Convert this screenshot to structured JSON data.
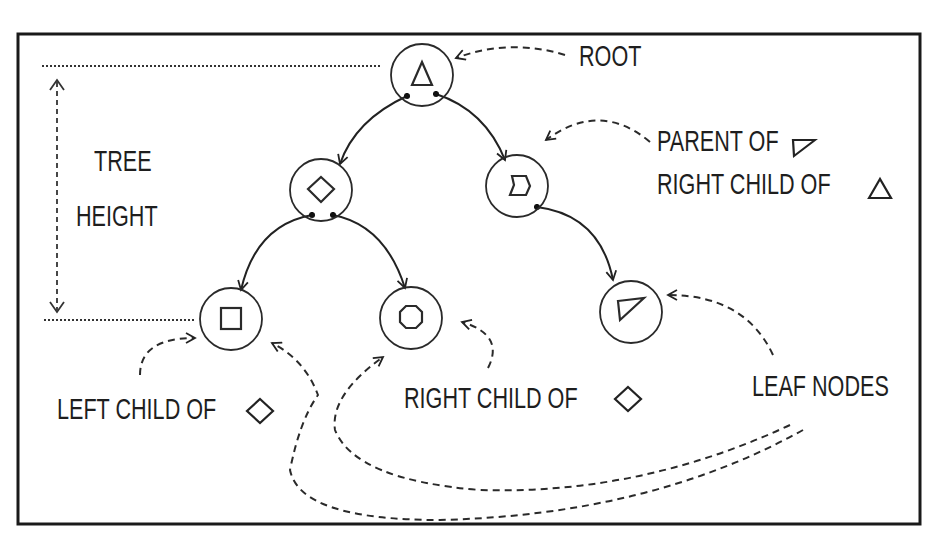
{
  "diagram": {
    "frame": {
      "x": 17,
      "y": 33,
      "width": 904,
      "height": 492,
      "stroke": "#222222"
    },
    "colors": {
      "ink": "#222222",
      "background": "#ffffff"
    },
    "nodes": [
      {
        "id": "root",
        "symbol": "triangle",
        "cx": 422,
        "cy": 75,
        "r": 31
      },
      {
        "id": "diamond",
        "symbol": "diamond",
        "cx": 321,
        "cy": 190,
        "r": 31
      },
      {
        "id": "notch",
        "symbol": "notched-pentagon",
        "cx": 517,
        "cy": 186,
        "r": 31
      },
      {
        "id": "square",
        "symbol": "square",
        "cx": 231,
        "cy": 319,
        "r": 31
      },
      {
        "id": "octagon",
        "symbol": "octagon",
        "cx": 411,
        "cy": 318,
        "r": 31
      },
      {
        "id": "right-triangle",
        "symbol": "right-triangle",
        "cx": 631,
        "cy": 312,
        "r": 31
      }
    ],
    "edges": [
      {
        "from": "root",
        "to": "diamond"
      },
      {
        "from": "root",
        "to": "notch"
      },
      {
        "from": "diamond",
        "to": "square"
      },
      {
        "from": "diamond",
        "to": "octagon"
      },
      {
        "from": "notch",
        "to": "right-triangle"
      }
    ],
    "labels": {
      "root": "ROOT",
      "parent_line1": "PARENT OF",
      "parent_line2": "RIGHT CHILD OF",
      "tree_height_line1": "TREE",
      "tree_height_line2": "HEIGHT",
      "left_child": "LEFT CHILD OF",
      "right_child": "RIGHT CHILD OF",
      "leaf_nodes": "LEAF NODES"
    }
  }
}
